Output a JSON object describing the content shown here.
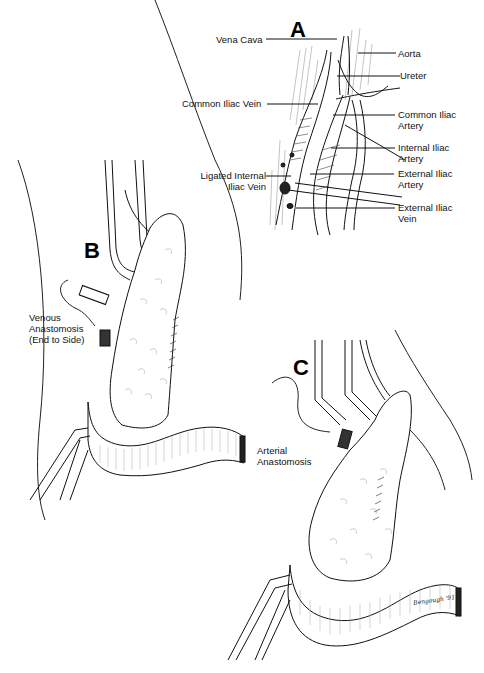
{
  "figure": {
    "panels": [
      {
        "letter": "A",
        "labels": {
          "vena_cava": "Vena Cava",
          "aorta": "Aorta",
          "ureter": "Ureter",
          "common_iliac_vein": "Common Iliac Vein",
          "common_iliac_artery_1": "Common Iliac",
          "common_iliac_artery_2": "Artery",
          "internal_iliac_artery_1": "Internal Iliac",
          "internal_iliac_artery_2": "Artery",
          "ligated_internal_iliac_vein_1": "Ligated Internal",
          "ligated_internal_iliac_vein_2": "Iliac Vein",
          "external_iliac_artery_1": "External Iliac",
          "external_iliac_artery_2": "Artery",
          "external_iliac_vein_1": "External Iliac",
          "external_iliac_vein_2": "Vein"
        }
      },
      {
        "letter": "B",
        "labels": {
          "venous_anastomosis_1": "Venous",
          "venous_anastomosis_2": "Anastomosis",
          "venous_anastomosis_3": "(End to Side)"
        }
      },
      {
        "letter": "C",
        "labels": {
          "arterial_anastomosis_1": "Arterial",
          "arterial_anastomosis_2": "Anastomosis"
        }
      }
    ],
    "signature": "Bengough '91"
  }
}
